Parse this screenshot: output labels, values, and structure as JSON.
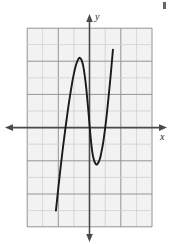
{
  "figure": {
    "title": "",
    "axis_labels": {
      "x": "x",
      "y": "y"
    },
    "colors": {
      "grid_minor": "#c9c9c9",
      "grid_major": "#8f8f8f",
      "grid_fill": "#f2f2f2",
      "axis": "#4a4a4a",
      "curve": "#1a1a1a",
      "background": "#ffffff"
    }
  },
  "chart_data": {
    "type": "line",
    "title": "",
    "xlabel": "x",
    "ylabel": "y",
    "grid": true,
    "legend": null,
    "xlim": [
      -4,
      4
    ],
    "ylim": [
      -6,
      6
    ],
    "xticks": [
      -4,
      -3,
      -2,
      -1,
      0,
      1,
      2,
      3,
      4
    ],
    "yticks": [
      -6,
      -5,
      -4,
      -3,
      -2,
      -1,
      0,
      1,
      2,
      3,
      4,
      5,
      6
    ],
    "tick_labels_shown": false,
    "annotations": [
      {
        "label": "local maximum",
        "x": -0.65,
        "y": 4.2
      },
      {
        "label": "local minimum",
        "x": 0.45,
        "y": -2.2
      }
    ],
    "series": [
      {
        "name": "cubic curve",
        "x": [
          -2.26,
          -2.15,
          -2.0,
          -1.85,
          -1.7,
          -1.55,
          -1.4,
          -1.3,
          -1.2,
          -1.1,
          -1.0,
          -0.9,
          -0.8,
          -0.7,
          -0.65,
          -0.6,
          -0.5,
          -0.4,
          -0.3,
          -0.2,
          -0.1,
          0.0,
          0.1,
          0.2,
          0.3,
          0.4,
          0.45,
          0.5,
          0.6,
          0.7,
          0.8,
          0.9,
          1.0,
          1.1,
          1.2,
          1.35,
          1.5,
          1.65,
          1.8,
          1.95,
          2.1,
          2.25,
          2.37
        ],
        "y": [
          -6.02,
          -5.0,
          -3.68,
          -2.4,
          -1.2,
          -0.1,
          0.95,
          1.6,
          2.2,
          2.75,
          3.25,
          3.65,
          3.95,
          4.15,
          4.2,
          4.19,
          4.05,
          3.7,
          3.1,
          2.3,
          1.3,
          0.2,
          -0.85,
          -1.6,
          -2.0,
          -2.2,
          -2.23,
          -2.2,
          -2.05,
          -1.75,
          -1.3,
          -0.75,
          -0.05,
          0.75,
          1.65,
          3.1,
          4.7,
          6.0,
          6.0,
          6.0,
          6.0,
          6.0,
          6.0
        ]
      }
    ]
  }
}
